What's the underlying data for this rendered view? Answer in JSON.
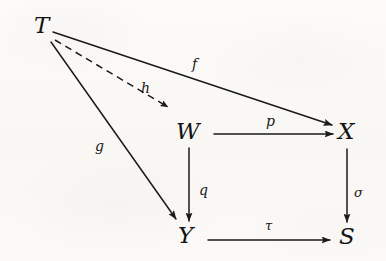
{
  "diagram": {
    "kind": "commutative-diagram",
    "title": "",
    "stroke_color": "#1a1a1a",
    "background_color": "#fbfaf8",
    "nodes": [
      {
        "id": "T",
        "label": "T",
        "x": 34,
        "y": 14
      },
      {
        "id": "W",
        "label": "W",
        "x": 176,
        "y": 120
      },
      {
        "id": "X",
        "label": "X",
        "x": 338,
        "y": 120
      },
      {
        "id": "Y",
        "label": "Y",
        "x": 178,
        "y": 224
      },
      {
        "id": "S",
        "label": "S",
        "x": 339,
        "y": 225
      }
    ],
    "edges": [
      {
        "id": "f",
        "label": "f",
        "from": "T",
        "to": "X",
        "style": "solid",
        "label_x": 192,
        "label_y": 57
      },
      {
        "id": "h",
        "label": "h",
        "from": "T",
        "to": "W",
        "style": "dashed",
        "label_x": 141,
        "label_y": 81
      },
      {
        "id": "g",
        "label": "g",
        "from": "T",
        "to": "Y",
        "style": "solid",
        "label_x": 95,
        "label_y": 139
      },
      {
        "id": "p",
        "label": "p",
        "from": "W",
        "to": "X",
        "style": "solid",
        "label_x": 266,
        "label_y": 114
      },
      {
        "id": "q",
        "label": "q",
        "from": "W",
        "to": "Y",
        "style": "solid",
        "label_x": 199,
        "label_y": 183
      },
      {
        "id": "sigma",
        "label": "σ",
        "from": "X",
        "to": "S",
        "style": "solid",
        "label_x": 354,
        "label_y": 186
      },
      {
        "id": "tau",
        "label": "τ",
        "from": "Y",
        "to": "S",
        "style": "solid",
        "label_x": 265,
        "label_y": 219
      }
    ]
  }
}
